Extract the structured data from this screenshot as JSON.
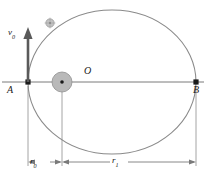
{
  "figure": {
    "type": "physics-orbit-diagram",
    "width": 206,
    "height": 180,
    "background_color": "#ffffff"
  },
  "labels": {
    "velocity": {
      "symbol": "v",
      "subscript": "0",
      "text": "v"
    },
    "center": {
      "text": "O"
    },
    "point_a": {
      "text": "A"
    },
    "point_b": {
      "text": "B"
    },
    "radius_near": {
      "symbol": "r",
      "subscript": "0",
      "text": "r"
    },
    "radius_far": {
      "symbol": "r",
      "subscript": "1",
      "text": "r"
    }
  },
  "colors": {
    "orbit_stroke": "#8a8a8a",
    "axis_stroke": "#6b6b6b",
    "dimension_stroke": "#7a7a7a",
    "extension_stroke": "#9a9a9a",
    "body_fill": "#b9b9b9",
    "body_stroke": "#8f8f8f",
    "satellite_fill": "#c2c2c2",
    "satellite_stroke": "#9a9a9a",
    "marker_fill": "#1a1a1a",
    "text_color": "#1a1a1a",
    "arrow_fill": "#5a5a5a"
  },
  "geometry": {
    "ellipse": {
      "cx": 112,
      "cy": 82,
      "rx": 84,
      "ry": 72
    },
    "point_a": {
      "x": 28,
      "y": 82
    },
    "point_b": {
      "x": 196,
      "y": 82
    },
    "center_body": {
      "cx": 62,
      "cy": 82,
      "r": 10,
      "dot_r": 1.8
    },
    "satellite": {
      "cx": 50,
      "cy": 23,
      "r": 4
    },
    "velocity_arrow": {
      "x": 28,
      "y_tail": 82,
      "y_head": 31
    },
    "dimension_line_y": 162,
    "extension_lines_x": [
      28,
      62,
      196
    ],
    "r0_span": {
      "from": 28,
      "to": 62
    },
    "r1_span": {
      "from": 62,
      "to": 196
    }
  }
}
